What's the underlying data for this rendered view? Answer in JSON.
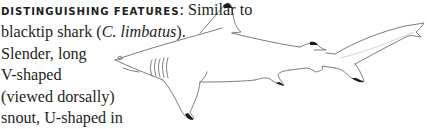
{
  "entry": {
    "heading": "DISTINGUISHING FEATURES",
    "heading_colon": ":",
    "lines": [
      {
        "pre": " Similar to",
        "ital": "",
        "post": ""
      },
      {
        "pre": "blacktip shark (",
        "ital": "C. limbatus",
        "post": ")."
      },
      {
        "pre": "Slender, long",
        "ital": "",
        "post": ""
      },
      {
        "pre": "V-shaped",
        "ital": "",
        "post": ""
      },
      {
        "pre": "(viewed dorsally)",
        "ital": "",
        "post": ""
      },
      {
        "pre": "snout, U-shaped in",
        "ital": "",
        "post": ""
      },
      {
        "pre": "",
        "ital": "C. limbatus",
        "post": ". Gill slits greater"
      }
    ]
  },
  "illustration": {
    "subject": "shark line drawing with black fin tips",
    "outline_color": "#6d6d6d",
    "tip_color": "#1a1a1a"
  }
}
